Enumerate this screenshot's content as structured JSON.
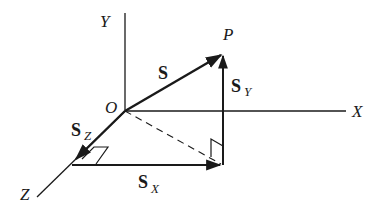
{
  "diagram": {
    "colors": {
      "ink": "#1a1a1a",
      "background": "#ffffff"
    },
    "axes": {
      "x_label": "X",
      "y_label": "Y",
      "z_label": "Z",
      "origin_label": "O"
    },
    "point_label": "P",
    "vectors": {
      "main": {
        "label": "S"
      },
      "y_component": {
        "label": "S",
        "subscript": "Y"
      },
      "x_component": {
        "label": "S",
        "subscript": "X"
      },
      "z_component": {
        "label": "S",
        "subscript": "Z"
      }
    },
    "annotations": [
      "right-angle marker at Z-X corner",
      "right-angle marker at projection foot",
      "dashed projection line from O to foot of P"
    ]
  }
}
